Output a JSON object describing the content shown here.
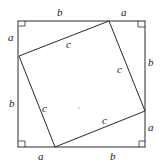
{
  "diagram": {
    "outer_square": {
      "x1": 18,
      "y1": 21,
      "x2": 145,
      "y2": 147
    },
    "inner_square": [
      [
        19,
        56
      ],
      [
        109,
        21
      ],
      [
        145,
        111
      ],
      [
        55,
        147
      ]
    ],
    "stroke_color": "#2a2a2a",
    "labels": {
      "top_b": "b",
      "top_a": "a",
      "left_a": "a",
      "left_b": "b",
      "right_b": "b",
      "right_a": "a",
      "bottom_a": "a",
      "bottom_b": "b",
      "c_top": "c",
      "c_right": "c",
      "c_left": "c",
      "c_bottom": "c"
    },
    "right_angle_markers": [
      "top-left",
      "top-right",
      "bottom-left",
      "bottom-right"
    ]
  }
}
